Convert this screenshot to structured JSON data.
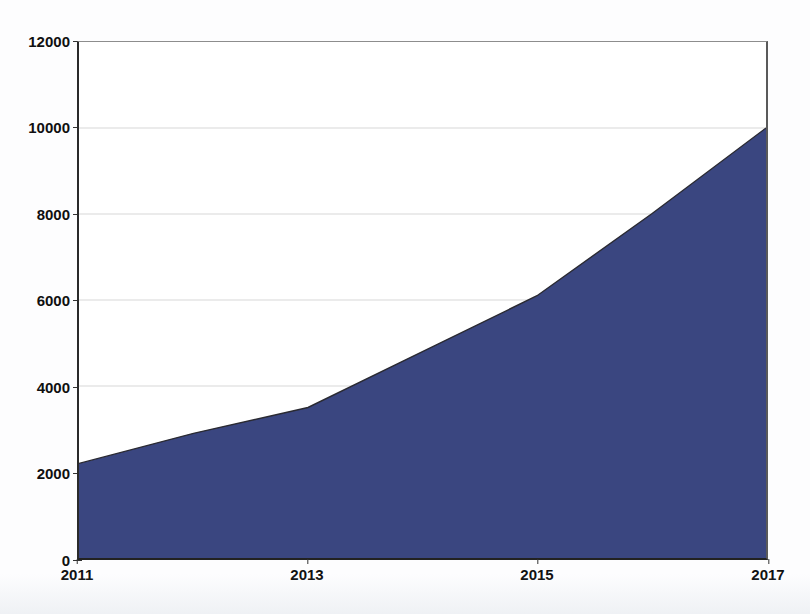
{
  "chart_data": {
    "type": "area",
    "title": "",
    "xlabel": "",
    "ylabel": "",
    "x": [
      2011,
      2012,
      2013,
      2014,
      2015,
      2016,
      2017
    ],
    "series": [
      {
        "name": "value",
        "values": [
          2200,
          2900,
          3500,
          4800,
          6100,
          8000,
          10000
        ]
      }
    ],
    "ylim": [
      0,
      12000
    ],
    "ytick_interval": 2000,
    "ytick_labels": [
      "12000",
      "10000",
      "8000",
      "6000",
      "4000",
      "2000",
      "0"
    ],
    "xtick_labels": [
      "2011",
      "2013",
      "2015",
      "2017"
    ],
    "grid": "horizontal",
    "legend": "none",
    "colors": {
      "area_fill": "#3a4680",
      "area_line": "#2a2a32",
      "axis": "#2a2a2a",
      "gridline": "#d7d7d7",
      "tick_label": "#101010",
      "plot_background": "#ffffff",
      "page_background": "#fdfdfe"
    }
  }
}
